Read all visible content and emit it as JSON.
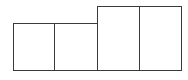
{
  "diagram": {
    "stroke_color": "#3a3a3a",
    "fill_color": "#ffffff",
    "boxes": [
      {
        "id": "box-1",
        "x": 13,
        "y": 23,
        "width": 42,
        "height": 48
      },
      {
        "id": "box-2",
        "x": 54,
        "y": 23,
        "width": 44,
        "height": 48
      },
      {
        "id": "box-3",
        "x": 97,
        "y": 6,
        "width": 43,
        "height": 65
      },
      {
        "id": "box-4",
        "x": 139,
        "y": 6,
        "width": 43,
        "height": 65
      }
    ]
  }
}
